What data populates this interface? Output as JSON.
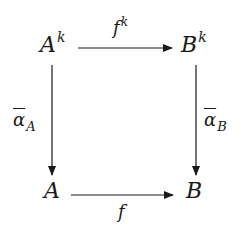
{
  "diagram": {
    "type": "commutative-square",
    "nodes": {
      "top_left": {
        "base": "A",
        "sup": "k"
      },
      "top_right": {
        "base": "B",
        "sup": "k"
      },
      "bottom_left": {
        "base": "A"
      },
      "bottom_right": {
        "base": "B"
      }
    },
    "arrows": {
      "top": {
        "from": "A^k",
        "to": "B^k",
        "label_base": "f",
        "label_sup": "k"
      },
      "bottom": {
        "from": "A",
        "to": "B",
        "label_base": "f"
      },
      "left": {
        "from": "A^k",
        "to": "A",
        "label_base": "α",
        "label_sub": "A"
      },
      "right": {
        "from": "B^k",
        "to": "B",
        "label_base": "α",
        "label_sub": "B"
      }
    },
    "colors": {
      "ink": "#1a1a1a",
      "background": "#ffffff"
    }
  }
}
